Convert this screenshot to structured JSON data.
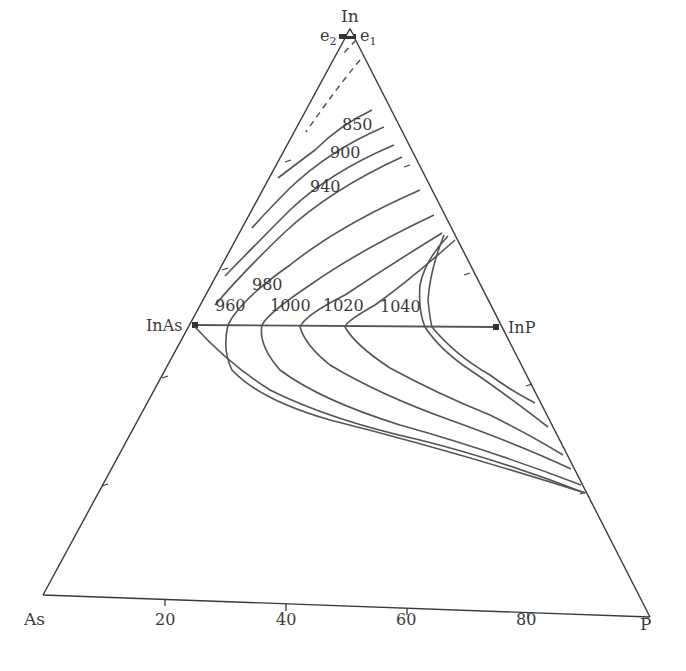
{
  "diagram": {
    "type": "ternary-liquidus-projection",
    "vertices": {
      "top": "In",
      "left": "As",
      "right": "P"
    },
    "compounds": {
      "left": "InAs",
      "right": "InP"
    },
    "eutectics": {
      "e1": "e",
      "e1_sub": "1",
      "e2": "e",
      "e2_sub": "2"
    },
    "axis_ticks": [
      "20",
      "40",
      "60",
      "80"
    ],
    "isotherm_labels": [
      "850",
      "900",
      "940",
      "960",
      "980",
      "1000",
      "1020",
      "1040"
    ],
    "colors": {
      "line": "#555555",
      "edge": "#3a3a3a",
      "background": "#ffffff"
    }
  }
}
